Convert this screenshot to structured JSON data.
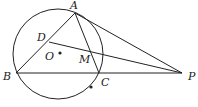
{
  "diagram": {
    "type": "geometry",
    "points": {
      "A": "A",
      "B": "B",
      "C": "C",
      "D": "D",
      "O": "O",
      "M": "M",
      "P": "P"
    },
    "segments": [
      "AB",
      "AC",
      "AP",
      "BP",
      "DP"
    ],
    "colors": {
      "stroke": "#222222",
      "background": "#ffffff"
    }
  }
}
